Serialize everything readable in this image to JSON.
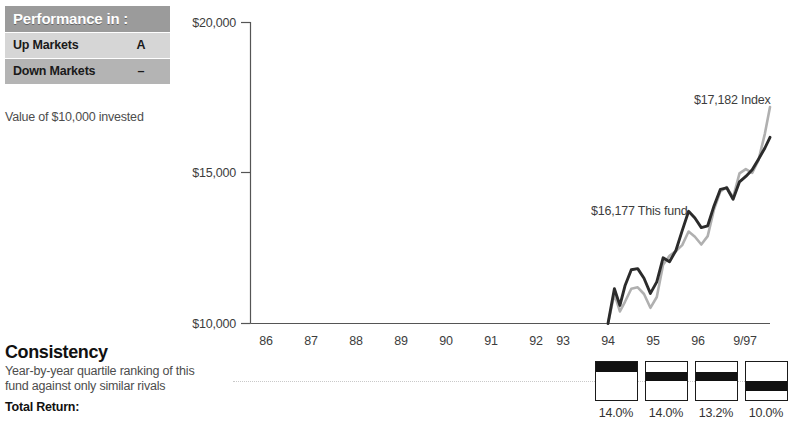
{
  "performance_panel": {
    "header": "Performance in :",
    "rows": [
      {
        "label": "Up Markets",
        "value": "A"
      },
      {
        "label": "Down Markets",
        "value": "–"
      }
    ],
    "caption": "Value of $10,000 invested"
  },
  "consistency": {
    "title": "Consistency",
    "description": "Year-by-year quartile ranking of this fund against only similar rivals",
    "total_return_label": "Total Return:"
  },
  "quartiles": {
    "boxes": [
      {
        "year": "94",
        "quartile": 1,
        "pct": "14.0%"
      },
      {
        "year": "95",
        "quartile": 2,
        "pct": "14.0%"
      },
      {
        "year": "96",
        "quartile": 2,
        "pct": "13.2%"
      },
      {
        "year": "9/97",
        "quartile": 3,
        "pct": "10.0%"
      }
    ]
  },
  "colors": {
    "fund_line": "#2b2b2b",
    "index_line": "#b0b0b0",
    "panel_header_bg": "#9b9b9b",
    "panel_row_light": "#d6d6d6",
    "panel_row_dark": "#b4b4b4",
    "axis": "#555555"
  },
  "chart_data": {
    "type": "line",
    "title": "Value of $10,000 invested",
    "xlabel": "",
    "ylabel": "",
    "ylim": [
      10000,
      20000
    ],
    "yticks": [
      10000,
      15000,
      20000
    ],
    "ytick_labels": [
      "$10,000",
      "$15,000",
      "$20,000"
    ],
    "grid": false,
    "legend": "annotations",
    "categories": [
      "86",
      "87",
      "88",
      "89",
      "90",
      "91",
      "92",
      "93",
      "94",
      "95",
      "96",
      "9/97"
    ],
    "x_range_plotted": [
      "93.9",
      "9/97"
    ],
    "annotations": [
      {
        "text": "$16,177 This fund",
        "series": "This fund"
      },
      {
        "text": "$17,182 Index",
        "series": "Index"
      }
    ],
    "series": [
      {
        "name": "This fund",
        "final_value": 16177,
        "color": "#2b2b2b",
        "x": [
          93.9,
          94.05,
          94.18,
          94.3,
          94.45,
          94.6,
          94.75,
          94.9,
          95.05,
          95.2,
          95.35,
          95.5,
          95.65,
          95.8,
          95.95,
          96.1,
          96.25,
          96.4,
          96.55,
          96.7,
          96.85,
          97.0,
          97.15,
          97.3,
          97.45,
          97.6,
          97.72
        ],
        "y": [
          10000,
          11150,
          10600,
          11250,
          11780,
          11820,
          11500,
          11000,
          11380,
          12180,
          12050,
          12420,
          13080,
          13720,
          13500,
          13180,
          13240,
          13900,
          14450,
          14500,
          14120,
          14700,
          14880,
          15100,
          15450,
          15820,
          16177
        ]
      },
      {
        "name": "Index",
        "final_value": 17182,
        "color": "#b0b0b0",
        "x": [
          93.9,
          94.05,
          94.18,
          94.3,
          94.45,
          94.6,
          94.75,
          94.9,
          95.05,
          95.2,
          95.35,
          95.5,
          95.65,
          95.8,
          95.95,
          96.1,
          96.25,
          96.4,
          96.55,
          96.7,
          96.85,
          97.0,
          97.15,
          97.3,
          97.45,
          97.6,
          97.72
        ],
        "y": [
          10000,
          10980,
          10400,
          10720,
          11150,
          11200,
          10980,
          10520,
          10880,
          11950,
          12250,
          12400,
          12600,
          13050,
          12880,
          12620,
          12900,
          13780,
          14380,
          14520,
          14180,
          14980,
          15120,
          15000,
          15420,
          16300,
          17182
        ]
      }
    ]
  },
  "axis": {
    "x_tick_labels": [
      "86",
      "87",
      "88",
      "89",
      "90",
      "91",
      "92",
      "93",
      "94",
      "95",
      "96",
      "9/97"
    ],
    "y_tick_labels": [
      "$20,000",
      "$15,000",
      "$10,000"
    ]
  }
}
